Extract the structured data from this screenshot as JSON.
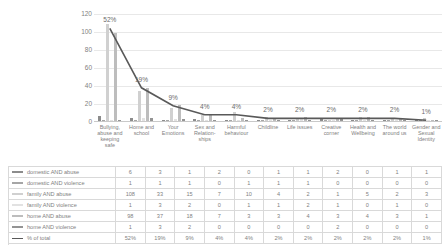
{
  "chart_data": {
    "type": "bar",
    "title": "",
    "xlabel": "",
    "ylabel": "",
    "ylim": [
      0,
      120
    ],
    "yticks": [
      0,
      20,
      40,
      60,
      80,
      100,
      120
    ],
    "grid": true,
    "legend_position": "table-below",
    "categories": [
      "Bullying, abuse and keeping safe",
      "Home and school",
      "Your Emotions",
      "Sex and Relation-ships",
      "Harmful behaviour",
      "Childline",
      "Life issues",
      "Creative corner",
      "Health and Wellbeing",
      "The world around us",
      "Gender and Sexual Identity"
    ],
    "series": [
      {
        "name": "domestic AND abuse",
        "type": "bar",
        "color": "#8c8c8c",
        "values": [
          6,
          3,
          1,
          2,
          0,
          1,
          1,
          2,
          0,
          1,
          1
        ]
      },
      {
        "name": "domestic AND violence",
        "type": "bar",
        "color": "#a6a6a6",
        "values": [
          1,
          1,
          1,
          0,
          1,
          1,
          1,
          0,
          0,
          0,
          0
        ]
      },
      {
        "name": "family AND abuse",
        "type": "bar",
        "color": "#d0d0d0",
        "values": [
          108,
          33,
          15,
          7,
          10,
          4,
          2,
          1,
          5,
          2,
          3
        ]
      },
      {
        "name": "family AND violence",
        "type": "bar",
        "color": "#e2e2e2",
        "values": [
          1,
          3,
          2,
          0,
          1,
          1,
          2,
          1,
          0,
          1,
          0
        ]
      },
      {
        "name": "home AND abuse",
        "type": "bar",
        "color": "#bdbdbd",
        "values": [
          98,
          37,
          18,
          7,
          3,
          3,
          4,
          3,
          4,
          3,
          1
        ]
      },
      {
        "name": "home AND violence",
        "type": "bar",
        "color": "#949494",
        "values": [
          1,
          3,
          2,
          0,
          0,
          0,
          0,
          2,
          0,
          0,
          0
        ]
      },
      {
        "name": "% of total",
        "type": "line",
        "color": "#595959",
        "values": [
          52,
          19,
          9,
          4,
          4,
          2,
          2,
          2,
          2,
          2,
          1
        ],
        "labels": [
          "52%",
          "19%",
          "9%",
          "4%",
          "4%",
          "2%",
          "2%",
          "2%",
          "2%",
          "2%",
          "1%"
        ]
      }
    ]
  },
  "table": {
    "rows": [
      {
        "label": "domestic AND abuse",
        "cells": [
          "6",
          "3",
          "1",
          "2",
          "0",
          "1",
          "1",
          "2",
          "0",
          "1",
          "1"
        ]
      },
      {
        "label": "domestic AND violence",
        "cells": [
          "1",
          "1",
          "1",
          "0",
          "1",
          "1",
          "1",
          "0",
          "0",
          "0",
          "0"
        ]
      },
      {
        "label": "family AND abuse",
        "cells": [
          "108",
          "33",
          "15",
          "7",
          "10",
          "4",
          "2",
          "1",
          "5",
          "2",
          "3"
        ]
      },
      {
        "label": "family AND violence",
        "cells": [
          "1",
          "3",
          "2",
          "0",
          "1",
          "1",
          "2",
          "1",
          "0",
          "1",
          "0"
        ]
      },
      {
        "label": "home AND abuse",
        "cells": [
          "98",
          "37",
          "18",
          "7",
          "3",
          "3",
          "4",
          "3",
          "4",
          "3",
          "1"
        ]
      },
      {
        "label": "home AND violence",
        "cells": [
          "1",
          "3",
          "2",
          "0",
          "0",
          "0",
          "0",
          "2",
          "0",
          "0",
          "0"
        ]
      },
      {
        "label": "% of total",
        "cells": [
          "52%",
          "19%",
          "9%",
          "4%",
          "4%",
          "2%",
          "2%",
          "2%",
          "2%",
          "2%",
          "1%"
        ]
      }
    ]
  }
}
